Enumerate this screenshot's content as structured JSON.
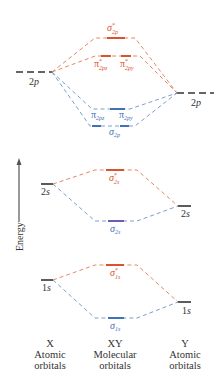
{
  "diagram": {
    "type": "molecular-orbital-energy-diagram",
    "energy_axis_label": "Energy",
    "colors": {
      "antibonding": "#d9542c",
      "bonding": "#3f72b8",
      "atomic": "#333333"
    },
    "atomic_orbitals": {
      "left": [
        {
          "id": "X-2p",
          "label": "2",
          "italic": "p"
        },
        {
          "id": "X-2s",
          "label": "2",
          "italic": "s"
        },
        {
          "id": "X-1s",
          "label": "1",
          "italic": "s"
        }
      ],
      "right": [
        {
          "id": "Y-2p",
          "label": "2",
          "italic": "p"
        },
        {
          "id": "Y-2s",
          "label": "2",
          "italic": "s"
        },
        {
          "id": "Y-1s",
          "label": "1",
          "italic": "s"
        }
      ]
    },
    "molecular_orbitals": [
      {
        "id": "sigma-star-2p",
        "symbol": "σ",
        "sub": "2p",
        "star": true,
        "type": "antibonding"
      },
      {
        "id": "pi-star-2pz",
        "symbol": "π",
        "sub": "2pz",
        "star": true,
        "type": "antibonding"
      },
      {
        "id": "pi-star-2py",
        "symbol": "π",
        "sub": "2py",
        "star": true,
        "type": "antibonding"
      },
      {
        "id": "pi-2pz",
        "symbol": "π",
        "sub": "2pz",
        "star": false,
        "type": "bonding"
      },
      {
        "id": "pi-2py",
        "symbol": "π",
        "sub": "2py",
        "star": false,
        "type": "bonding"
      },
      {
        "id": "sigma-2p",
        "symbol": "σ",
        "sub": "2p",
        "star": false,
        "type": "bonding"
      },
      {
        "id": "sigma-star-2s",
        "symbol": "σ",
        "sub": "2s",
        "star": true,
        "type": "antibonding"
      },
      {
        "id": "sigma-2s",
        "symbol": "σ",
        "sub": "2s",
        "star": false,
        "type": "bonding"
      },
      {
        "id": "sigma-star-1s",
        "symbol": "σ",
        "sub": "1s",
        "star": true,
        "type": "antibonding"
      },
      {
        "id": "sigma-1s",
        "symbol": "σ",
        "sub": "1s",
        "star": false,
        "type": "bonding"
      }
    ],
    "columns": [
      {
        "name": "X",
        "line1": "Atomic",
        "line2": "orbitals"
      },
      {
        "name": "XY",
        "line1": "Molecular",
        "line2": "orbitals"
      },
      {
        "name": "Y",
        "line1": "Atomic",
        "line2": "orbitals"
      }
    ]
  }
}
